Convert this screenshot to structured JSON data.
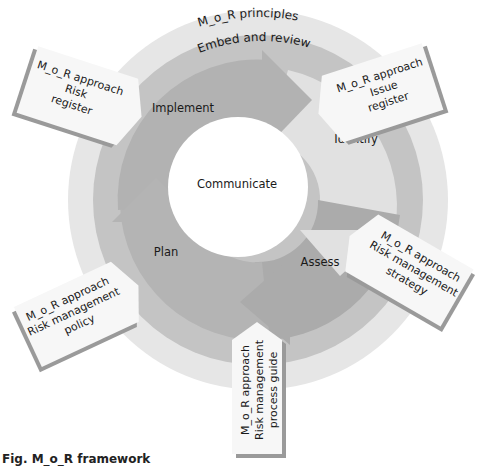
{
  "diagram": {
    "title": "M_o_R framework",
    "outer_ring": {
      "label": "M_o_R principles"
    },
    "middle_ring": {
      "label": "Embed and review"
    },
    "center": {
      "label": "Communicate"
    },
    "cycle_steps": [
      {
        "label": "Identify"
      },
      {
        "label": "Assess"
      },
      {
        "label": "Plan"
      },
      {
        "label": "Implement"
      }
    ],
    "approach_documents": [
      {
        "line1": "M_o_R approach",
        "line2": "Risk",
        "line3": "register"
      },
      {
        "line1": "M_o_R approach",
        "line2": "Issue",
        "line3": "register"
      },
      {
        "line1": "M_o_R approach",
        "line2": "Risk management",
        "line3": "strategy"
      },
      {
        "line1": "M_o_R approach",
        "line2": "Risk management",
        "line3": "process guide"
      },
      {
        "line1": "M_o_R approach",
        "line2": "Risk management",
        "line3": "policy"
      }
    ],
    "caption": "Fig. M_o_R framework",
    "colors": {
      "outer_ring": "#e6e6e6",
      "middle_ring": "#c4c4c4",
      "arrow_dark": "#a9a9a9",
      "arrow_light": "#e1e1e1",
      "arrow_mid": "#b9b9b9",
      "box_fill": "#f7f7f7",
      "box_shadow": "#9a9a9a",
      "center": "#ffffff"
    }
  }
}
